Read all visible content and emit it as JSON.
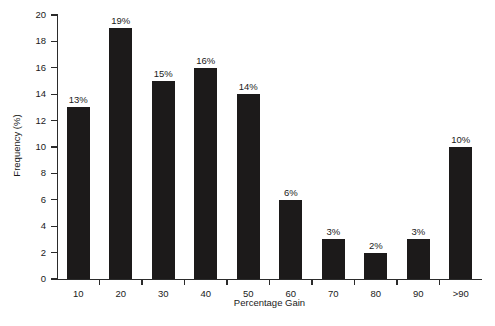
{
  "chart_data": {
    "type": "bar",
    "title": "",
    "subtitle": "",
    "xlabel": "Percentage Gain",
    "ylabel": "Frequency (%)",
    "categories": [
      "10",
      "20",
      "30",
      "40",
      "50",
      "60",
      "70",
      "80",
      "90",
      ">90"
    ],
    "values": [
      13,
      19,
      15,
      16,
      14,
      6,
      3,
      2,
      3,
      10
    ],
    "data_labels": [
      "13%",
      "19%",
      "15%",
      "16%",
      "14%",
      "6%",
      "3%",
      "2%",
      "3%",
      "10%"
    ],
    "ylim": [
      0,
      20
    ],
    "ytick_values": [
      0,
      2,
      4,
      6,
      8,
      10,
      12,
      14,
      16,
      18,
      20
    ],
    "ytick_labels": [
      "0",
      "2",
      "4",
      "6",
      "8",
      "10",
      "12",
      "14",
      "16",
      "18",
      "20"
    ],
    "grid": false,
    "legend": false,
    "legend_position": "none",
    "bar_color": "#1c1a1a",
    "axis_color": "#2b2b2b",
    "background_color": "#ffffff",
    "series": [
      {
        "name": "Frequency",
        "values": [
          13,
          19,
          15,
          16,
          14,
          6,
          3,
          2,
          3,
          10
        ]
      }
    ]
  }
}
